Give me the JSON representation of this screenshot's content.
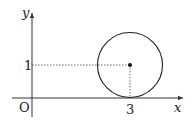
{
  "diagram": {
    "type": "coordinate-plane-circle",
    "axes": {
      "x_label": "x",
      "y_label": "y",
      "origin_label": "O"
    },
    "ticks": {
      "x_tick_label": "3",
      "y_tick_label": "1"
    },
    "circle": {
      "center": [
        3,
        1
      ],
      "radius": 1,
      "tangent_to": "x-axis",
      "center_marked": true
    },
    "guide_lines": [
      {
        "from": [
          0,
          1
        ],
        "to": [
          3,
          1
        ],
        "style": "dotted"
      },
      {
        "from": [
          3,
          1
        ],
        "to": [
          3,
          0
        ],
        "style": "dotted"
      }
    ],
    "colors": {
      "stroke": "#222222",
      "axis": "#333333",
      "background": "#ffffff"
    }
  }
}
